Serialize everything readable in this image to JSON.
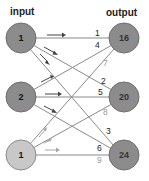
{
  "titles": {
    "input": "input",
    "output": "output"
  },
  "colors": {
    "input_node": "#8c8c8c",
    "input_node_light": "#c8c8c8",
    "output_node": "#8c8c8c",
    "node_stroke": "#6e6e6e",
    "edge": "#8a8a8a",
    "edge_light": "#b4b4b4",
    "arrow_dark": "#444444",
    "arrow_light": "#a8a8a8",
    "label_dark": "#222222",
    "label_light": "#9a9a9a"
  },
  "input_nodes": [
    {
      "label": "1",
      "style": "dark"
    },
    {
      "label": "2",
      "style": "dark"
    },
    {
      "label": "1",
      "style": "light"
    }
  ],
  "output_nodes": [
    {
      "label": "16"
    },
    {
      "label": "20"
    },
    {
      "label": "24"
    }
  ],
  "weights": {
    "to_output_16": [
      "1",
      "4",
      "7"
    ],
    "to_output_20": [
      "2",
      "5",
      "8"
    ],
    "to_output_24": [
      "3",
      "6",
      "9"
    ]
  },
  "edge_labels": [
    {
      "from": 0,
      "to": 0,
      "weight": "1"
    },
    {
      "from": 1,
      "to": 0,
      "weight": "4"
    },
    {
      "from": 2,
      "to": 0,
      "weight": "7"
    },
    {
      "from": 0,
      "to": 1,
      "weight": "2"
    },
    {
      "from": 1,
      "to": 1,
      "weight": "5"
    },
    {
      "from": 2,
      "to": 1,
      "weight": "8"
    },
    {
      "from": 0,
      "to": 2,
      "weight": "3"
    },
    {
      "from": 1,
      "to": 2,
      "weight": "6"
    },
    {
      "from": 2,
      "to": 2,
      "weight": "9"
    }
  ]
}
